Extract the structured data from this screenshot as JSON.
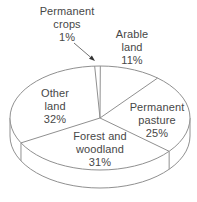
{
  "figure": {
    "background": "#ffffff",
    "title": ""
  },
  "chart_data": {
    "type": "pie",
    "projection": "3d",
    "fill_style": "unfilled-white-with-gray-outline",
    "title": "",
    "unit": "%",
    "categories": [
      "Permanent crops",
      "Arable land",
      "Permanent pasture",
      "Forest and woodland",
      "Other land"
    ],
    "values": [
      1,
      11,
      25,
      31,
      32
    ],
    "legend": "none-direct-labels",
    "labels": [
      {
        "name": "permanent-crops",
        "lines": [
          "Permanent",
          "crops",
          "1%"
        ]
      },
      {
        "name": "arable-land",
        "lines": [
          "Arable",
          "land",
          "11%"
        ]
      },
      {
        "name": "permanent-pasture",
        "lines": [
          "Permanent",
          "pasture",
          "25%"
        ]
      },
      {
        "name": "forest-woodland",
        "lines": [
          "Forest and",
          "woodland",
          "31%"
        ]
      },
      {
        "name": "other-land",
        "lines": [
          "Other",
          "land",
          "32%"
        ]
      }
    ],
    "colors": {
      "outline": "#909090",
      "fill": "#ffffff",
      "label_text": "#474747",
      "leader_line": "#737373",
      "leader_head": "#333333"
    },
    "render": {
      "cx": 100,
      "cy": 118,
      "rx": 90,
      "ry": 52,
      "depth": 18,
      "start_angle_deg": 93.4,
      "clockwise": true
    },
    "leader": {
      "from": [
        74,
        43
      ],
      "to": [
        95,
        61
      ]
    }
  }
}
